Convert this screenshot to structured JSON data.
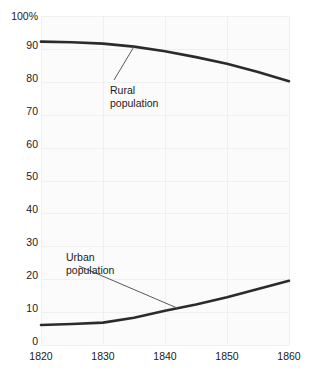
{
  "chart_data": {
    "type": "line",
    "title": "",
    "subtitle": "",
    "xlabel": "",
    "ylabel": "",
    "xlim": [
      1820,
      1860
    ],
    "ylim": [
      0,
      100
    ],
    "grid": true,
    "legend_position": "inline-annotations",
    "x_ticks": [
      "1820",
      "1830",
      "1840",
      "1850",
      "1860"
    ],
    "x_tick_values": [
      1820,
      1830,
      1840,
      1850,
      1860
    ],
    "y_ticks": [
      "0",
      "10",
      "20",
      "30",
      "40",
      "50",
      "60",
      "70",
      "80",
      "90",
      "100%"
    ],
    "y_tick_values": [
      0,
      10,
      20,
      30,
      40,
      50,
      60,
      70,
      80,
      90,
      100
    ],
    "x": [
      1820,
      1825,
      1830,
      1835,
      1840,
      1845,
      1850,
      1855,
      1860
    ],
    "series": [
      {
        "name": "Rural population",
        "values": [
          92.2,
          92.0,
          91.6,
          90.7,
          89.3,
          87.5,
          85.5,
          83.0,
          80.2
        ],
        "color": "#2b2b2b"
      },
      {
        "name": "Urban population",
        "values": [
          6.1,
          6.4,
          6.8,
          8.3,
          10.4,
          12.3,
          14.5,
          17.0,
          19.5
        ],
        "color": "#2b2b2b"
      }
    ],
    "annotations": [
      {
        "id": "rural",
        "text": "Rural\npopulation",
        "target_x": 1835,
        "target_y": 90.7
      },
      {
        "id": "urban",
        "text": "Urban\npopulation",
        "target_x": 1842,
        "target_y": 11.2
      }
    ]
  },
  "axis": {
    "y_tick_0": "0",
    "y_tick_10": "10",
    "y_tick_20": "20",
    "y_tick_30": "30",
    "y_tick_40": "40",
    "y_tick_50": "50",
    "y_tick_60": "60",
    "y_tick_70": "70",
    "y_tick_80": "80",
    "y_tick_90": "90",
    "y_tick_100": "100%",
    "x_tick_1820": "1820",
    "x_tick_1830": "1830",
    "x_tick_1840": "1840",
    "x_tick_1850": "1850",
    "x_tick_1860": "1860"
  },
  "labels": {
    "rural": "Rural\npopulation",
    "urban": "Urban\npopulation"
  },
  "colors": {
    "line": "#2b2b2b",
    "grid": "#f0f0f0",
    "plot_background": "#fbfbfb",
    "page_background": "#ffffff",
    "text": "#1a1a1a",
    "leader": "#5a5a5a"
  }
}
